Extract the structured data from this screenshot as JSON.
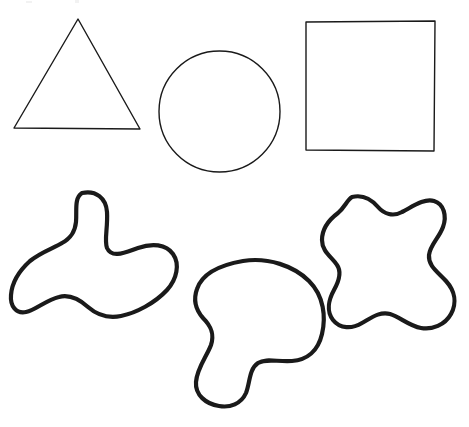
{
  "canvas": {
    "width": 469,
    "height": 427,
    "background_color": "#ffffff",
    "stroke_color": "#1a1a1a",
    "geometric_stroke_width": 1.4,
    "blob_stroke_width": 4.2,
    "description": "Line drawing of three geometric outlines above three irregular closed blob outlines"
  },
  "shapes": [
    {
      "id": "triangle",
      "name": "triangle",
      "row": "top",
      "stroke_weight": "thin",
      "bounds": {
        "x": 13,
        "y": 18,
        "width": 128,
        "height": 112
      },
      "vertices": "78,19 140,129 14,128",
      "path": "M 78 19 L 140 129 L 14 128 Z"
    },
    {
      "id": "circle",
      "name": "circle",
      "row": "top",
      "stroke_weight": "thin",
      "bounds": {
        "x": 159,
        "y": 51,
        "width": 121,
        "height": 121
      },
      "center": {
        "cx": 219.5,
        "cy": 111.5
      },
      "radius": 60.5,
      "path": "M 219.5 51 C 252.9 51 280 78.1 280 111.5 C 280 144.9 252.9 172 219.5 172 C 186.1 172 159 144.9 159 111.5 C 159 78.1 186.1 51 219.5 51 Z"
    },
    {
      "id": "square",
      "name": "square",
      "row": "top",
      "stroke_weight": "thin",
      "bounds": {
        "x": 305,
        "y": 21,
        "width": 130,
        "height": 130
      },
      "vertices": "306,22 435,21 434,151 306,150",
      "path": "M 306 22 L 435 21 L 434 151 L 306 150 Z"
    },
    {
      "id": "blob-trefoil",
      "name": "three-lobed-blob",
      "row": "bottom",
      "stroke_weight": "thick",
      "bounds": {
        "x": 10,
        "y": 190,
        "width": 168,
        "height": 137
      },
      "path": "M 82 193 C 96 190 106 198 107 212 C 108 228 104 240 107 248 C 112 259 126 252 138 248 C 152 243 166 244 173 254 C 180 264 177 279 167 290 C 155 303 136 313 121 316 C 106 319 96 314 88 307 C 79 299 70 294 59 297 C 46 300 36 310 26 312 C 16 314 10 306 11 295 C 12 282 20 270 30 261 C 41 252 54 248 62 243 C 71 238 75 232 76 222 C 77 211 74 198 82 193 Z"
    },
    {
      "id": "blob-bean",
      "name": "bean-shaped-blob",
      "row": "bottom",
      "stroke_weight": "thick",
      "bounds": {
        "x": 195,
        "y": 257,
        "width": 131,
        "height": 151
      },
      "path": "M 243 261 C 268 257 294 266 309 281 C 324 296 326 317 322 334 C 318 351 307 360 292 361 C 277 362 266 358 258 363 C 249 369 250 383 246 393 C 241 404 230 408 219 406 C 206 404 195 395 196 382 C 197 368 207 356 211 345 C 215 333 210 325 203 318 C 196 310 193 300 197 289 C 201 277 214 266 243 261 Z"
    },
    {
      "id": "blob-quatrefoil",
      "name": "four-lobed-blob",
      "row": "bottom",
      "stroke_weight": "thick",
      "bounds": {
        "x": 322,
        "y": 194,
        "width": 134,
        "height": 138
      },
      "path": "M 352 197 C 364 194 372 200 378 207 C 384 214 393 217 402 212 C 412 207 424 198 434 201 C 444 204 447 216 443 227 C 439 238 430 245 429 255 C 428 266 438 272 446 281 C 455 291 457 303 451 314 C 445 325 432 330 421 328 C 409 326 400 317 390 314 C 380 311 371 318 362 323 C 352 329 340 329 333 320 C 326 311 329 299 334 290 C 339 281 342 272 337 265 C 332 257 322 252 322 240 C 322 228 330 219 338 213 C 345 207 347 200 352 197 Z"
    }
  ],
  "accessibility": {
    "alt_text": "Six outlined shapes: a triangle, a circle and a square on the top row; three irregular curved blobs on the bottom row."
  }
}
